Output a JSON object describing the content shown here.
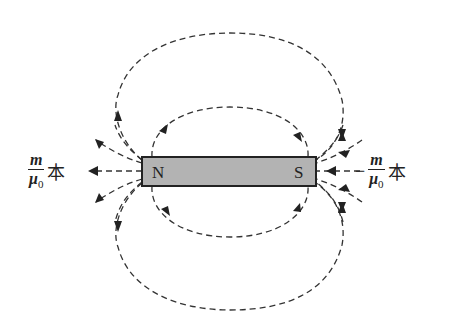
{
  "magnet": {
    "north_label": "N",
    "south_label": "S",
    "fill_color": "#b3b3b3",
    "border_color": "#222222"
  },
  "labels": {
    "left": {
      "numerator": "m",
      "denominator": "μ",
      "denominator_sub": "0",
      "unit": "本",
      "sign": ""
    },
    "right": {
      "numerator": "m",
      "denominator": "μ",
      "denominator_sub": "0",
      "unit": "本",
      "sign": "−"
    }
  },
  "field_lines": {
    "style": "dashed",
    "direction": "out of N, into S"
  }
}
